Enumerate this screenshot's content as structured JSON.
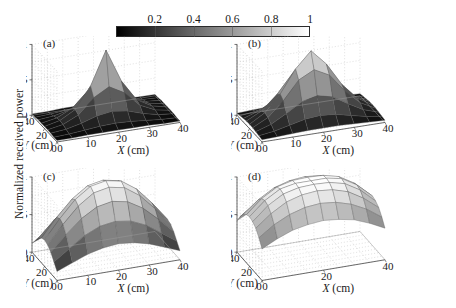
{
  "figure": {
    "ylabel": "Normalized received power",
    "background": "#ffffff",
    "colorbar": {
      "name": "grayscale-colorbar",
      "min": 0,
      "max": 1,
      "tick_values": [
        0.2,
        0.4,
        0.6,
        0.8,
        1
      ],
      "tick_labels": [
        "0.2",
        "0.4",
        "0.6",
        "0.8",
        "1"
      ],
      "low_color": "#000000",
      "high_color": "#ffffff",
      "orientation": "horizontal"
    }
  },
  "chart_data": [
    {
      "type": "heatmap",
      "panel": "(a)",
      "title": "",
      "projection": "3d-surface",
      "xlabel": "X (cm)",
      "ylabel": "Y (cm)",
      "zlabel": "Normalized received power",
      "xlim": [
        0,
        40
      ],
      "ylim": [
        0,
        40
      ],
      "zlim": [
        0,
        1
      ],
      "xticks": [
        0,
        10,
        20,
        30,
        40
      ],
      "xticklabels": [
        "0",
        "10",
        "20",
        "30",
        "40"
      ],
      "yticks": [
        0,
        20,
        40
      ],
      "yticklabels": [
        "0",
        "20",
        "40"
      ],
      "zticks": [
        0,
        0.5,
        1
      ],
      "zticklabels": [
        "0",
        "0.5",
        "1"
      ],
      "grid": true,
      "x": [
        0,
        5,
        10,
        15,
        20,
        25,
        30,
        35,
        40
      ],
      "y": [
        0,
        5,
        10,
        15,
        20,
        25,
        30,
        35,
        40
      ],
      "z": [
        [
          0.02,
          0.02,
          0.03,
          0.03,
          0.03,
          0.03,
          0.03,
          0.02,
          0.02
        ],
        [
          0.02,
          0.03,
          0.05,
          0.07,
          0.08,
          0.07,
          0.05,
          0.03,
          0.02
        ],
        [
          0.03,
          0.05,
          0.1,
          0.17,
          0.2,
          0.17,
          0.1,
          0.05,
          0.03
        ],
        [
          0.03,
          0.07,
          0.17,
          0.38,
          0.5,
          0.38,
          0.17,
          0.07,
          0.03
        ],
        [
          0.03,
          0.08,
          0.2,
          0.5,
          0.97,
          0.5,
          0.2,
          0.08,
          0.03
        ],
        [
          0.03,
          0.07,
          0.17,
          0.38,
          0.5,
          0.38,
          0.17,
          0.07,
          0.03
        ],
        [
          0.03,
          0.05,
          0.1,
          0.17,
          0.2,
          0.17,
          0.1,
          0.05,
          0.03
        ],
        [
          0.02,
          0.03,
          0.05,
          0.07,
          0.08,
          0.07,
          0.05,
          0.03,
          0.02
        ],
        [
          0.02,
          0.02,
          0.03,
          0.03,
          0.03,
          0.03,
          0.03,
          0.02,
          0.02
        ]
      ]
    },
    {
      "type": "heatmap",
      "panel": "(b)",
      "title": "",
      "projection": "3d-surface",
      "xlabel": "X (cm)",
      "ylabel": "Y (cm)",
      "zlabel": "Normalized received power",
      "xlim": [
        0,
        40
      ],
      "ylim": [
        0,
        40
      ],
      "zlim": [
        0,
        1
      ],
      "xticks": [
        0,
        10,
        20,
        30,
        40
      ],
      "xticklabels": [
        "0",
        "10",
        "20",
        "30",
        "40"
      ],
      "yticks": [
        0,
        20,
        40
      ],
      "yticklabels": [
        "0",
        "20",
        "40"
      ],
      "zticks": [
        0,
        0.5,
        1
      ],
      "zticklabels": [
        "0",
        "0.5",
        "1"
      ],
      "grid": true,
      "x": [
        0,
        5,
        10,
        15,
        20,
        25,
        30,
        35,
        40
      ],
      "y": [
        0,
        5,
        10,
        15,
        20,
        25,
        30,
        35,
        40
      ],
      "z": [
        [
          0.03,
          0.04,
          0.05,
          0.06,
          0.06,
          0.06,
          0.05,
          0.04,
          0.03
        ],
        [
          0.04,
          0.07,
          0.12,
          0.17,
          0.19,
          0.17,
          0.12,
          0.07,
          0.04
        ],
        [
          0.05,
          0.12,
          0.24,
          0.37,
          0.42,
          0.37,
          0.24,
          0.12,
          0.05
        ],
        [
          0.06,
          0.17,
          0.37,
          0.63,
          0.74,
          0.63,
          0.37,
          0.17,
          0.06
        ],
        [
          0.06,
          0.19,
          0.42,
          0.74,
          0.96,
          0.74,
          0.42,
          0.19,
          0.06
        ],
        [
          0.06,
          0.17,
          0.37,
          0.63,
          0.74,
          0.63,
          0.37,
          0.17,
          0.06
        ],
        [
          0.05,
          0.12,
          0.24,
          0.37,
          0.42,
          0.37,
          0.24,
          0.12,
          0.05
        ],
        [
          0.04,
          0.07,
          0.12,
          0.17,
          0.19,
          0.17,
          0.12,
          0.07,
          0.04
        ],
        [
          0.03,
          0.04,
          0.05,
          0.06,
          0.06,
          0.06,
          0.05,
          0.04,
          0.03
        ]
      ]
    },
    {
      "type": "heatmap",
      "panel": "(c)",
      "title": "",
      "projection": "3d-surface",
      "xlabel": "X (cm)",
      "ylabel": "Y (cm)",
      "zlabel": "Normalized received power",
      "xlim": [
        0,
        40
      ],
      "ylim": [
        0,
        40
      ],
      "zlim": [
        0,
        1
      ],
      "xticks": [
        0,
        10,
        20,
        30,
        40
      ],
      "xticklabels": [
        "0",
        "10",
        "20",
        "30",
        "40"
      ],
      "yticks": [
        0,
        20,
        40
      ],
      "yticklabels": [
        "0",
        "20",
        "40"
      ],
      "zticks": [
        0,
        0.5,
        1
      ],
      "zticklabels": [
        "0",
        "0.5",
        "1"
      ],
      "grid": true,
      "x": [
        0,
        5,
        10,
        15,
        20,
        25,
        30,
        35,
        40
      ],
      "y": [
        0,
        5,
        10,
        15,
        20,
        25,
        30,
        35,
        40
      ],
      "z": [
        [
          0.12,
          0.2,
          0.28,
          0.33,
          0.35,
          0.33,
          0.28,
          0.2,
          0.12
        ],
        [
          0.2,
          0.34,
          0.48,
          0.57,
          0.6,
          0.57,
          0.48,
          0.34,
          0.2
        ],
        [
          0.28,
          0.48,
          0.66,
          0.78,
          0.82,
          0.78,
          0.66,
          0.48,
          0.28
        ],
        [
          0.33,
          0.57,
          0.78,
          0.92,
          0.96,
          0.92,
          0.78,
          0.57,
          0.33
        ],
        [
          0.35,
          0.6,
          0.82,
          0.96,
          1.0,
          0.96,
          0.82,
          0.6,
          0.35
        ],
        [
          0.33,
          0.57,
          0.78,
          0.92,
          0.96,
          0.92,
          0.78,
          0.57,
          0.33
        ],
        [
          0.28,
          0.48,
          0.66,
          0.78,
          0.82,
          0.78,
          0.66,
          0.48,
          0.28
        ],
        [
          0.2,
          0.34,
          0.48,
          0.57,
          0.6,
          0.57,
          0.48,
          0.34,
          0.2
        ],
        [
          0.12,
          0.2,
          0.28,
          0.33,
          0.35,
          0.33,
          0.28,
          0.2,
          0.12
        ]
      ]
    },
    {
      "type": "heatmap",
      "panel": "(d)",
      "title": "",
      "projection": "3d-surface",
      "xlabel": "X (cm)",
      "ylabel": "Y (cm)",
      "zlabel": "Normalized received power",
      "xlim": [
        0,
        40
      ],
      "ylim": [
        0,
        40
      ],
      "zlim": [
        0,
        1
      ],
      "xticks": [
        0,
        20,
        40
      ],
      "xticklabels": [
        "0",
        "20",
        "40"
      ],
      "yticks": [
        0,
        20,
        40
      ],
      "yticklabels": [
        "0",
        "20",
        "40"
      ],
      "zticks": [
        0,
        0.5,
        1
      ],
      "zticklabels": [
        "0",
        "0.5",
        "1"
      ],
      "grid": true,
      "x": [
        0,
        5,
        10,
        15,
        20,
        25,
        30,
        35,
        40
      ],
      "y": [
        0,
        5,
        10,
        15,
        20,
        25,
        30,
        35,
        40
      ],
      "z": [
        [
          0.42,
          0.52,
          0.6,
          0.64,
          0.66,
          0.64,
          0.6,
          0.52,
          0.42
        ],
        [
          0.52,
          0.66,
          0.76,
          0.82,
          0.84,
          0.82,
          0.76,
          0.66,
          0.52
        ],
        [
          0.6,
          0.76,
          0.88,
          0.94,
          0.96,
          0.94,
          0.88,
          0.76,
          0.6
        ],
        [
          0.64,
          0.82,
          0.94,
          0.99,
          1.0,
          0.99,
          0.94,
          0.82,
          0.64
        ],
        [
          0.66,
          0.84,
          0.96,
          1.0,
          1.0,
          1.0,
          0.96,
          0.84,
          0.66
        ],
        [
          0.64,
          0.82,
          0.94,
          0.99,
          1.0,
          0.99,
          0.94,
          0.82,
          0.64
        ],
        [
          0.6,
          0.76,
          0.88,
          0.94,
          0.96,
          0.94,
          0.88,
          0.76,
          0.6
        ],
        [
          0.52,
          0.66,
          0.76,
          0.82,
          0.84,
          0.82,
          0.76,
          0.66,
          0.52
        ],
        [
          0.42,
          0.52,
          0.6,
          0.64,
          0.66,
          0.64,
          0.6,
          0.52,
          0.42
        ]
      ]
    }
  ]
}
